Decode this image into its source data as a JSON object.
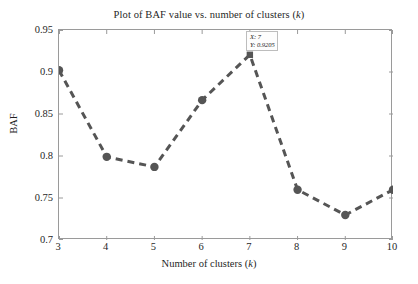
{
  "chart_data": {
    "type": "line",
    "title": "Plot of BAF value vs. number of clusters (k)",
    "title_prefix": "Plot of BAF value vs. number of clusters (",
    "title_italic": "k",
    "title_suffix": ")",
    "xlabel": "Number of clusters (k)",
    "xlabel_prefix": "Number of clusters (",
    "xlabel_italic": "k",
    "xlabel_suffix": ")",
    "ylabel": "BAF",
    "x": [
      3,
      4,
      5,
      6,
      7,
      8,
      9,
      10
    ],
    "values": [
      0.902,
      0.799,
      0.787,
      0.8665,
      0.9205,
      0.7598,
      0.7298,
      0.7598
    ],
    "categories": [
      "3",
      "4",
      "5",
      "6",
      "7",
      "8",
      "9",
      "10"
    ],
    "xlim": [
      3,
      10
    ],
    "ylim": [
      0.7,
      0.95
    ],
    "xticks": [
      "3",
      "4",
      "5",
      "6",
      "7",
      "8",
      "9",
      "10"
    ],
    "yticks": [
      "0.7",
      "0.75",
      "0.8",
      "0.85",
      "0.9",
      "0.95"
    ],
    "ytick_values": [
      0.7,
      0.75,
      0.8,
      0.85,
      0.9,
      0.95
    ],
    "grid": false,
    "legend": null,
    "line_style": "dashed",
    "line_color": "#555555",
    "marker_color": "#555555",
    "marker_shape": "circle",
    "highlight_marker_shape": "square",
    "highlight_index": 4,
    "axis_color": "#9a9a9a",
    "background": "#ffffff"
  },
  "datatip": {
    "x_text": "X: 7",
    "y_text": "Y: 0.9205"
  }
}
